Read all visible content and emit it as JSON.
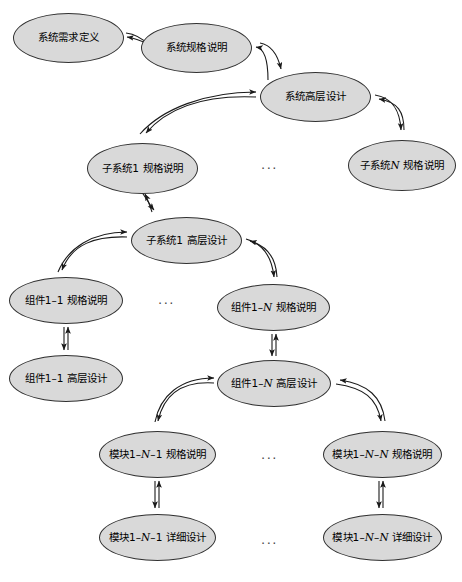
{
  "diagram": {
    "type": "hierarchical-node-graph",
    "canvas": {
      "width": 462,
      "height": 582
    },
    "style": {
      "node_fill": "#d9d9d9",
      "node_stroke": "#303030",
      "edge_stroke": "#1a1a1a",
      "background": "#ffffff"
    },
    "nodes": [
      {
        "id": "n1",
        "label": "系统需求定义",
        "plain": "系统需求定义",
        "x": 13,
        "y": 13,
        "w": 111,
        "h": 50
      },
      {
        "id": "n2",
        "label": "系统规格说明",
        "plain": "系统规格说明",
        "x": 141,
        "y": 23,
        "w": 111,
        "h": 50
      },
      {
        "id": "n3",
        "label": "系统高层设计",
        "plain": "系统高层设计",
        "x": 260,
        "y": 72,
        "w": 111,
        "h": 50
      },
      {
        "id": "n4",
        "label": "子系统1 规格说明",
        "plain": "子系统1 规格说明",
        "x": 87,
        "y": 143,
        "w": 111,
        "h": 51
      },
      {
        "id": "n5",
        "label": "子系统<i>N</i> 规格说明",
        "plain": "子系统N 规格说明",
        "x": 348,
        "y": 140,
        "w": 108,
        "h": 51
      },
      {
        "id": "n6",
        "label": "子系统1 高层设计",
        "plain": "子系统1 高层设计",
        "x": 131,
        "y": 217,
        "w": 111,
        "h": 47
      },
      {
        "id": "n7",
        "label": "组件1–1 规格说明",
        "plain": "组件1-1 规格说明",
        "x": 9,
        "y": 277,
        "w": 114,
        "h": 47
      },
      {
        "id": "n8",
        "label": "组件1–<i>N</i> 规格说明",
        "plain": "组件1-N 规格说明",
        "x": 217,
        "y": 284,
        "w": 113,
        "h": 47
      },
      {
        "id": "n9",
        "label": "组件1–1 高层设计",
        "plain": "组件1-1 高层设计",
        "x": 9,
        "y": 355,
        "w": 114,
        "h": 47
      },
      {
        "id": "n10",
        "label": "组件1–<i>N</i> 高层设计",
        "plain": "组件1-N 高层设计",
        "x": 217,
        "y": 360,
        "w": 114,
        "h": 47
      },
      {
        "id": "n11",
        "label": "模块1–<i>N</i>–1 规格说明",
        "plain": "模块1-N-1 规格说明",
        "x": 99,
        "y": 431,
        "w": 117,
        "h": 47
      },
      {
        "id": "n12",
        "label": "模块1–<i>N</i>–<i>N</i> 规格说明",
        "plain": "模块1-N-N 规格说明",
        "x": 323,
        "y": 431,
        "w": 119,
        "h": 47
      },
      {
        "id": "n13",
        "label": "模块1–<i>N</i>–1 详细设计",
        "plain": "模块1-N-1 详细设计",
        "x": 99,
        "y": 514,
        "w": 117,
        "h": 47
      },
      {
        "id": "n14",
        "label": "模块1–<i>N</i>–<i>N</i> 详细设计",
        "plain": "模块1-N-N 详细设计",
        "x": 323,
        "y": 514,
        "w": 119,
        "h": 47
      }
    ],
    "ellipses_markers": [
      {
        "id": "e1",
        "text": "...",
        "x": 261,
        "y": 158
      },
      {
        "id": "e2",
        "text": "...",
        "x": 158,
        "y": 293
      },
      {
        "id": "e3",
        "text": "...",
        "x": 261,
        "y": 448
      },
      {
        "id": "e4",
        "text": "...",
        "x": 261,
        "y": 533
      }
    ],
    "edges": [
      {
        "from": "n2",
        "to": "n1",
        "kind": "bidirectional-curve"
      },
      {
        "from": "n3",
        "to": "n2",
        "kind": "bidirectional-curve"
      },
      {
        "from": "n3",
        "to": "n4",
        "kind": "bidirectional-curve"
      },
      {
        "from": "n3",
        "to": "n5",
        "kind": "bidirectional-curve"
      },
      {
        "from": "n6",
        "to": "n4",
        "kind": "bidirectional-curve"
      },
      {
        "from": "n6",
        "to": "n7",
        "kind": "bidirectional-curve"
      },
      {
        "from": "n6",
        "to": "n8",
        "kind": "bidirectional-curve"
      },
      {
        "from": "n7",
        "to": "n9",
        "kind": "bidirectional-straight"
      },
      {
        "from": "n8",
        "to": "n10",
        "kind": "bidirectional-straight"
      },
      {
        "from": "n10",
        "to": "n11",
        "kind": "bidirectional-curve"
      },
      {
        "from": "n10",
        "to": "n12",
        "kind": "bidirectional-curve"
      },
      {
        "from": "n11",
        "to": "n13",
        "kind": "bidirectional-straight"
      },
      {
        "from": "n12",
        "to": "n14",
        "kind": "bidirectional-straight"
      }
    ]
  }
}
